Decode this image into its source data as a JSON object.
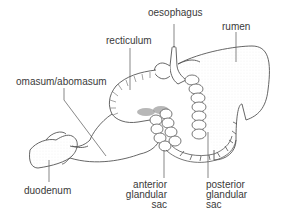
{
  "diagram": {
    "type": "anatomical line drawing",
    "colors": {
      "line": "#555555",
      "stipple": "#b8b8b8",
      "text": "#3a3a3a",
      "background": "#ffffff"
    },
    "labels": {
      "oesophagus": "oesophagus",
      "rumen": "rumen",
      "recticulum": "recticulum",
      "omasum_abomasum": "omasum/abomasum",
      "duodenum": "duodenum",
      "anterior_glandular_sac": [
        "anterior",
        "glandular",
        "sac"
      ],
      "posterior_glandular_sac": [
        "posterior",
        "glandular",
        "sac"
      ]
    }
  }
}
